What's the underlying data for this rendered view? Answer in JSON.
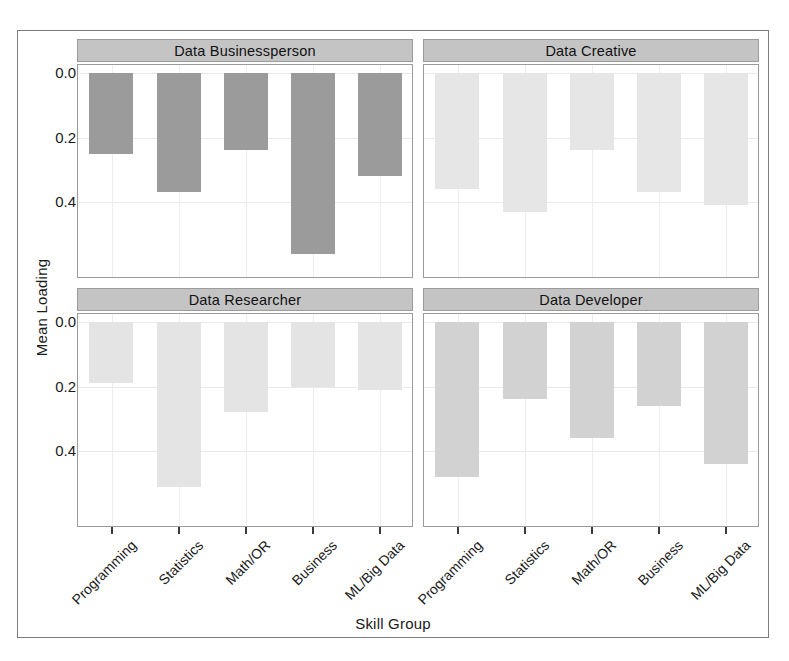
{
  "chart_data": {
    "type": "bar",
    "title": "",
    "xlabel": "Skill Group",
    "ylabel": "Mean Loading",
    "categories": [
      "Programming",
      "Statistics",
      "Math/OR",
      "Business",
      "ML/Big Data"
    ],
    "yticks": [
      "0.0",
      "0.2",
      "0.4"
    ],
    "ytick_values": [
      0.0,
      0.2,
      0.4
    ],
    "ylim": [
      0.0,
      0.62
    ],
    "y_axis_inverted": true,
    "grid": true,
    "legend": "none",
    "facet_layout": "2x2",
    "panels": [
      {
        "name": "Data Businessperson",
        "position": "top-left",
        "bar_color": "#9b9b9b",
        "values": [
          0.25,
          0.37,
          0.24,
          0.56,
          0.32
        ]
      },
      {
        "name": "Data Creative",
        "position": "top-right",
        "bar_color": "#e6e6e6",
        "values": [
          0.36,
          0.43,
          0.24,
          0.37,
          0.41
        ]
      },
      {
        "name": "Data Researcher",
        "position": "bottom-left",
        "bar_color": "#e4e4e4",
        "values": [
          0.19,
          0.51,
          0.28,
          0.2,
          0.21
        ]
      },
      {
        "name": "Data Developer",
        "position": "bottom-right",
        "bar_color": "#d2d2d2",
        "values": [
          0.48,
          0.24,
          0.36,
          0.26,
          0.44
        ]
      }
    ]
  },
  "axes": {
    "y_title": "Mean Loading",
    "x_title": "Skill Group"
  }
}
